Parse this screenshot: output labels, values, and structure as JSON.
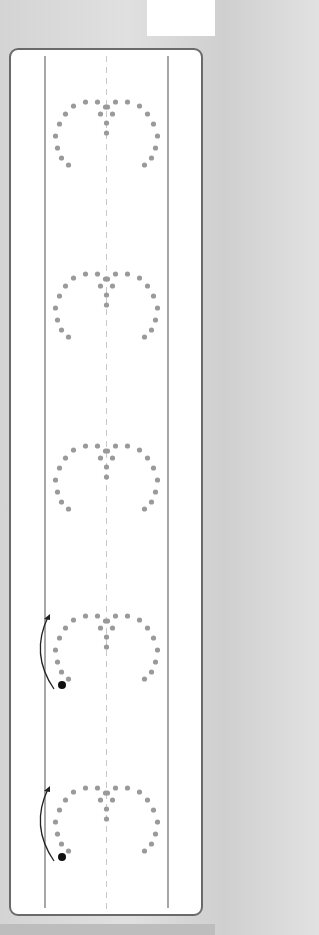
{
  "worksheet": {
    "type": "heart tracing practice",
    "rows": 5,
    "rows_with_start_guide": [
      4,
      5
    ],
    "colors": {
      "dot": "#9a9a9a",
      "start_dot": "#111111",
      "arrow": "#222222",
      "border": "#6a6a6a",
      "guide_line": "#777777",
      "center_dash": "#c8c8c8"
    },
    "heart_tops": [
      100,
      272,
      444,
      614,
      786
    ]
  }
}
